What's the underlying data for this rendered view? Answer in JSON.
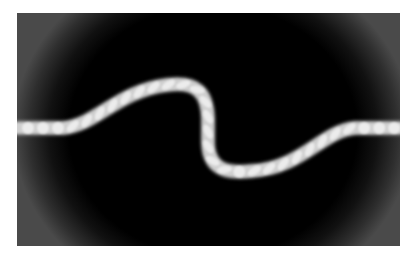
{
  "figure": {
    "colors": {
      "frame": "#4a4a4a",
      "center": "#000000",
      "element_fill": "#e6e6e6",
      "element_core": "#f4f4f4",
      "glow": "#9a9a9a"
    },
    "frame": {
      "x": 17,
      "y": 13,
      "width": 383,
      "height": 233
    },
    "path": "M 0 115 L 46 115 C 80 112 100 78 150 72 C 180 68 190 80 191 105 L 191 130 C 192 160 215 160 235 158 C 285 155 305 118 338 115 L 383 115",
    "straight_left_elements": [
      11,
      26,
      41
    ],
    "straight_right_elements": [
      347,
      362,
      377
    ]
  }
}
